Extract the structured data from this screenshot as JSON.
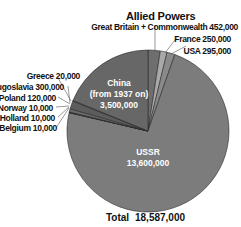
{
  "chart_data": {
    "type": "pie",
    "title": "Allied Powers",
    "total_label": "Total",
    "total_value": "18,587,000",
    "slices": [
      {
        "name": "Great Britain + Commonwealth",
        "value": 452000,
        "label": "Great Britain + Commonwealth 452,000",
        "color": "#6e6e6e"
      },
      {
        "name": "France",
        "value": 250000,
        "label": "France 250,000",
        "color": "#a9a9a9"
      },
      {
        "name": "USA",
        "value": 295000,
        "label": "USA 295,000",
        "color": "#8a8a8a"
      },
      {
        "name": "USSR",
        "value": 13600000,
        "label": "USSR 13,600,000",
        "color": "#7c7c7c"
      },
      {
        "name": "Belgium",
        "value": 10000,
        "label": "Belgium 10,000",
        "color": "#6a6a6a"
      },
      {
        "name": "Holland",
        "value": 10000,
        "label": "Holland 10,000",
        "color": "#6a6a6a"
      },
      {
        "name": "Norway",
        "value": 10000,
        "label": "Norway 10,000",
        "color": "#6a6a6a"
      },
      {
        "name": "Poland",
        "value": 120000,
        "label": "Poland 120,000",
        "color": "#6a6a6a"
      },
      {
        "name": "Yugoslavia",
        "value": 300000,
        "label": "Yugoslavia 300,000",
        "color": "#5c5c5c"
      },
      {
        "name": "Greece",
        "value": 20000,
        "label": "Greece 20,000",
        "color": "#6a6a6a"
      },
      {
        "name": "China",
        "value": 3500000,
        "label": "China (from 1937 on) 3,500,000",
        "color": "#676767"
      }
    ]
  },
  "labels": {
    "title": "Allied Powers",
    "gb": "Great Britain + Commonwealth 452,000",
    "france": "France 250,000",
    "usa": "USA 295,000",
    "greece": "Greece 20,000",
    "yugoslavia": "Yugoslavia 300,000",
    "poland": "Poland 120,000",
    "norway": "Norway 10,000",
    "holland": "Holland 10,000",
    "belgium": "Belgium 10,000",
    "china_line1": "China",
    "china_line2": "(from 1937 on)",
    "china_line3": "3,500,000",
    "ussr_line1": "USSR",
    "ussr_line2": "13,600,000",
    "total_label": "Total",
    "total_value": "18,587,000"
  }
}
